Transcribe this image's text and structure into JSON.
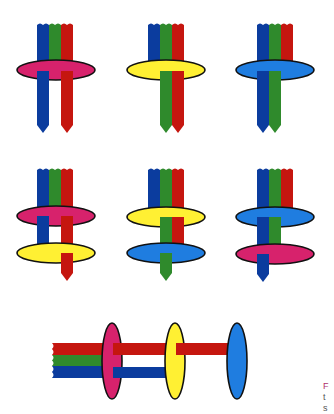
{
  "colors": {
    "strand_blue": "#0b3c9e",
    "strand_green": "#2f8a2c",
    "strand_red": "#c5160f",
    "ring_pink": "#d7226c",
    "ring_yellow": "#fff033",
    "ring_blue": "#1f7de0",
    "outline": "#111111"
  },
  "row1": [
    {
      "ring": "pink",
      "passing": [
        "blue",
        "red"
      ]
    },
    {
      "ring": "yellow",
      "passing": [
        "green",
        "red"
      ]
    },
    {
      "ring": "blue",
      "passing": [
        "blue",
        "green"
      ]
    }
  ],
  "row2": [
    {
      "rings": [
        "pink",
        "yellow"
      ],
      "passing_first": [
        "blue",
        "red"
      ],
      "passing_second": [
        "red"
      ]
    },
    {
      "rings": [
        "yellow",
        "blue"
      ],
      "passing_first": [
        "green",
        "red"
      ],
      "passing_second": [
        "green"
      ]
    },
    {
      "rings": [
        "blue",
        "pink"
      ],
      "passing_first": [
        "blue",
        "green"
      ],
      "passing_second": [
        "blue"
      ]
    }
  ],
  "row3": {
    "rings": [
      "pink",
      "yellow",
      "blue"
    ],
    "strands": [
      "red",
      "green",
      "blue"
    ]
  },
  "caption": {
    "line1": "F",
    "line2": "t",
    "line3": "s"
  }
}
